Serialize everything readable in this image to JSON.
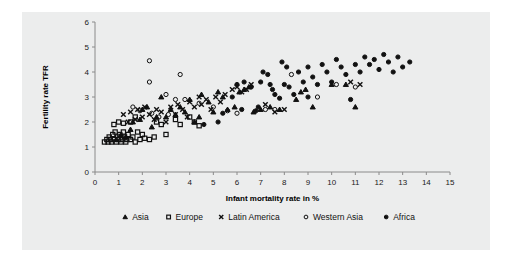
{
  "chart_data": {
    "type": "scatter",
    "title": "",
    "xlabel": "Infant mortality rate in %",
    "ylabel": "Fertility rate TFR",
    "xlim": [
      0,
      15
    ],
    "ylim": [
      0,
      6
    ],
    "xticks": [
      "0",
      "1",
      "2",
      "3",
      "4",
      "5",
      "6",
      "7",
      "8",
      "9",
      "10",
      "11",
      "12",
      "13",
      "14",
      "15"
    ],
    "yticks": [
      "0",
      "1",
      "2",
      "3",
      "4",
      "5",
      "6"
    ],
    "grid": false,
    "legend_position": "bottom",
    "series": [
      {
        "name": "Asia",
        "marker": "triangle",
        "color": "#111111",
        "points": [
          [
            0.9,
            1.3
          ],
          [
            1.1,
            1.5
          ],
          [
            1.3,
            1.4
          ],
          [
            1.5,
            1.7
          ],
          [
            1.6,
            2.0
          ],
          [
            1.9,
            2.1
          ],
          [
            2.0,
            2.5
          ],
          [
            2.2,
            2.6
          ],
          [
            2.4,
            1.8
          ],
          [
            2.6,
            2.2
          ],
          [
            2.8,
            3.0
          ],
          [
            3.0,
            2.2
          ],
          [
            3.2,
            2.5
          ],
          [
            3.4,
            2.3
          ],
          [
            3.6,
            2.6
          ],
          [
            3.8,
            2.4
          ],
          [
            4.0,
            2.9
          ],
          [
            4.2,
            2.0
          ],
          [
            4.4,
            2.2
          ],
          [
            4.5,
            3.1
          ],
          [
            4.8,
            2.8
          ],
          [
            5.0,
            2.4
          ],
          [
            5.2,
            3.2
          ],
          [
            5.4,
            3.0
          ],
          [
            5.6,
            2.5
          ],
          [
            5.9,
            2.6
          ],
          [
            6.1,
            3.2
          ],
          [
            6.3,
            3.3
          ],
          [
            6.5,
            3.4
          ],
          [
            6.7,
            2.4
          ],
          [
            7.0,
            2.5
          ],
          [
            7.4,
            2.6
          ],
          [
            7.8,
            2.5
          ],
          [
            8.5,
            2.9
          ],
          [
            8.7,
            3.2
          ],
          [
            8.9,
            3.3
          ],
          [
            9.2,
            2.6
          ],
          [
            10.0,
            3.5
          ],
          [
            10.6,
            3.5
          ],
          [
            11.0,
            2.6
          ]
        ]
      },
      {
        "name": "Europe",
        "marker": "square",
        "color": "#111111",
        "points": [
          [
            0.4,
            1.2
          ],
          [
            0.5,
            1.3
          ],
          [
            0.55,
            1.2
          ],
          [
            0.6,
            1.4
          ],
          [
            0.65,
            1.3
          ],
          [
            0.7,
            1.2
          ],
          [
            0.75,
            1.5
          ],
          [
            0.8,
            1.3
          ],
          [
            0.85,
            1.6
          ],
          [
            0.9,
            1.2
          ],
          [
            0.95,
            1.4
          ],
          [
            1.0,
            1.3
          ],
          [
            1.05,
            1.5
          ],
          [
            1.1,
            1.2
          ],
          [
            1.15,
            1.3
          ],
          [
            1.2,
            1.6
          ],
          [
            1.25,
            1.4
          ],
          [
            1.3,
            1.2
          ],
          [
            1.35,
            1.3
          ],
          [
            1.4,
            1.5
          ],
          [
            1.5,
            1.3
          ],
          [
            1.6,
            1.4
          ],
          [
            1.7,
            1.2
          ],
          [
            1.8,
            1.6
          ],
          [
            0.8,
            1.9
          ],
          [
            1.0,
            2.0
          ],
          [
            1.2,
            1.95
          ],
          [
            1.5,
            2.0
          ],
          [
            1.9,
            1.3
          ],
          [
            2.0,
            1.5
          ],
          [
            2.1,
            1.35
          ],
          [
            2.3,
            1.3
          ],
          [
            2.5,
            1.4
          ],
          [
            2.6,
            2.0
          ],
          [
            2.8,
            1.9
          ],
          [
            3.0,
            1.5
          ],
          [
            3.4,
            2.1
          ],
          [
            3.6,
            1.9
          ],
          [
            4.0,
            2.2
          ],
          [
            4.2,
            2.0
          ],
          [
            4.4,
            1.85
          ],
          [
            1.7,
            2.2
          ]
        ]
      },
      {
        "name": "Latin America",
        "marker": "x",
        "color": "#111111",
        "points": [
          [
            1.2,
            2.3
          ],
          [
            1.4,
            2.0
          ],
          [
            1.5,
            2.4
          ],
          [
            1.7,
            2.1
          ],
          [
            1.8,
            2.5
          ],
          [
            2.0,
            2.2
          ],
          [
            2.1,
            2.6
          ],
          [
            2.3,
            2.3
          ],
          [
            2.5,
            2.1
          ],
          [
            2.6,
            2.5
          ],
          [
            2.8,
            2.4
          ],
          [
            3.0,
            2.0
          ],
          [
            3.2,
            2.6
          ],
          [
            3.4,
            2.3
          ],
          [
            3.5,
            2.7
          ],
          [
            3.7,
            2.5
          ],
          [
            3.9,
            2.2
          ],
          [
            4.0,
            2.8
          ],
          [
            4.2,
            2.6
          ],
          [
            4.4,
            3.0
          ],
          [
            4.5,
            2.7
          ],
          [
            4.7,
            2.9
          ],
          [
            4.9,
            2.5
          ],
          [
            5.1,
            3.0
          ],
          [
            5.3,
            2.8
          ],
          [
            5.5,
            3.1
          ],
          [
            5.8,
            3.3
          ],
          [
            6.0,
            3.4
          ],
          [
            6.2,
            3.2
          ],
          [
            6.4,
            3.3
          ],
          [
            6.6,
            3.5
          ],
          [
            7.2,
            2.7
          ],
          [
            7.6,
            2.4
          ],
          [
            8.0,
            2.5
          ],
          [
            10.8,
            3.6
          ],
          [
            11.2,
            3.5
          ]
        ]
      },
      {
        "name": "Western Asia",
        "marker": "circle-open",
        "color": "#111111",
        "points": [
          [
            2.3,
            4.45
          ],
          [
            2.3,
            3.6
          ],
          [
            3.6,
            3.9
          ],
          [
            3.0,
            3.1
          ],
          [
            3.4,
            2.9
          ],
          [
            1.6,
            2.6
          ],
          [
            1.9,
            2.45
          ],
          [
            2.4,
            2.35
          ],
          [
            2.7,
            2.2
          ],
          [
            3.1,
            2.3
          ],
          [
            3.8,
            2.9
          ],
          [
            4.4,
            2.75
          ],
          [
            5.0,
            2.6
          ],
          [
            5.6,
            2.45
          ],
          [
            6.0,
            2.35
          ],
          [
            7.2,
            2.5
          ],
          [
            7.6,
            2.5
          ],
          [
            8.3,
            3.9
          ],
          [
            9.4,
            3.0
          ],
          [
            10.2,
            3.5
          ],
          [
            11.0,
            3.4
          ]
        ]
      },
      {
        "name": "Africa",
        "marker": "circle",
        "color": "#111111",
        "points": [
          [
            4.6,
            1.9
          ],
          [
            5.4,
            2.35
          ],
          [
            5.8,
            3.0
          ],
          [
            6.0,
            3.5
          ],
          [
            6.3,
            3.6
          ],
          [
            6.6,
            3.4
          ],
          [
            6.8,
            2.45
          ],
          [
            7.0,
            3.6
          ],
          [
            7.1,
            4.0
          ],
          [
            7.3,
            3.9
          ],
          [
            7.4,
            3.5
          ],
          [
            7.5,
            3.3
          ],
          [
            7.6,
            3.1
          ],
          [
            7.8,
            2.95
          ],
          [
            8.0,
            3.5
          ],
          [
            8.2,
            3.4
          ],
          [
            8.4,
            3.1
          ],
          [
            8.6,
            4.0
          ],
          [
            8.8,
            3.6
          ],
          [
            9.0,
            4.2
          ],
          [
            9.2,
            3.8
          ],
          [
            9.4,
            3.5
          ],
          [
            9.6,
            4.3
          ],
          [
            9.8,
            4.0
          ],
          [
            10.0,
            3.6
          ],
          [
            10.2,
            4.5
          ],
          [
            10.4,
            4.2
          ],
          [
            10.6,
            3.9
          ],
          [
            10.8,
            2.9
          ],
          [
            11.0,
            4.3
          ],
          [
            11.2,
            4.0
          ],
          [
            11.4,
            4.6
          ],
          [
            11.6,
            4.3
          ],
          [
            11.8,
            4.5
          ],
          [
            12.0,
            4.1
          ],
          [
            12.2,
            4.7
          ],
          [
            12.4,
            4.4
          ],
          [
            12.8,
            4.6
          ],
          [
            13.0,
            4.2
          ],
          [
            13.3,
            4.4
          ],
          [
            6.9,
            2.6
          ],
          [
            6.2,
            2.5
          ],
          [
            5.2,
            2.0
          ],
          [
            9.0,
            3.0
          ],
          [
            7.9,
            4.4
          ],
          [
            8.1,
            4.2
          ],
          [
            12.6,
            4.0
          ]
        ]
      }
    ]
  },
  "legend": {
    "items": [
      {
        "label": "Asia",
        "marker": "triangle"
      },
      {
        "label": "Europe",
        "marker": "square"
      },
      {
        "label": "Latin America",
        "marker": "x"
      },
      {
        "label": "Western Asia",
        "marker": "circle-open"
      },
      {
        "label": "Africa",
        "marker": "circle"
      }
    ]
  }
}
